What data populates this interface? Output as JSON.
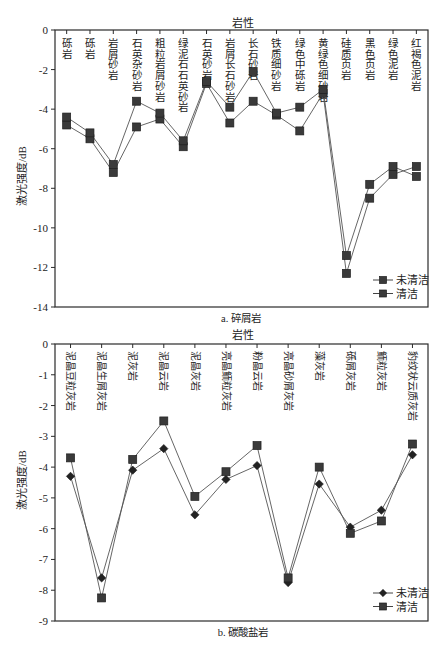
{
  "chart_data": [
    {
      "type": "line",
      "title": "a. 碎屑岩",
      "xlabel": "岩性",
      "ylabel": "激光强度/dB",
      "x_axis_position": "top",
      "ylim": [
        -14,
        0
      ],
      "yticks": [
        0,
        -2,
        -4,
        -6,
        -8,
        -10,
        -12,
        -14
      ],
      "ytick_labels": [
        "0",
        "-2",
        "-4",
        "-6",
        "-8",
        "-10",
        "-12",
        "-14"
      ],
      "grid": false,
      "legend_position": "lower right",
      "categories": [
        "砾岩",
        "砾岩",
        "岩屑砂岩",
        "石英杂砂岩",
        "粗粒岩屑砂岩",
        "绿泥石石英砂岩",
        "石英砂岩",
        "岩屑长石砂岩",
        "长石砂岩",
        "铁质细砂岩",
        "绿色中砾岩",
        "黄绿色细砂岩",
        "硅质页岩",
        "黑色页岩",
        "绿色泥岩",
        "红褐色泥岩"
      ],
      "series": [
        {
          "name": "未清洁",
          "marker": "square",
          "values": [
            -4.8,
            -5.5,
            -7.2,
            -4.9,
            -4.5,
            -5.9,
            -2.7,
            -4.7,
            -3.6,
            -4.3,
            -5.1,
            -3.2,
            -12.3,
            -8.5,
            -7.3,
            -6.9
          ]
        },
        {
          "name": "清洁",
          "marker": "square",
          "values": [
            -4.4,
            -5.2,
            -6.8,
            -3.6,
            -4.2,
            -5.6,
            -2.6,
            -3.9,
            -2.1,
            -4.2,
            -3.9,
            -3.0,
            -11.4,
            -7.8,
            -6.9,
            -7.4
          ]
        }
      ]
    },
    {
      "type": "line",
      "title": "b. 碳酸盐岩",
      "xlabel": "岩性",
      "ylabel": "激光强度/dB",
      "x_axis_position": "top",
      "ylim": [
        -9,
        0
      ],
      "yticks": [
        0,
        -1,
        -2,
        -3,
        -4,
        -5,
        -6,
        -7,
        -8,
        -9
      ],
      "ytick_labels": [
        "0",
        "-1",
        "-2",
        "-3",
        "-4",
        "-5",
        "-6",
        "-7",
        "-8",
        "-9"
      ],
      "grid": false,
      "legend_position": "lower right",
      "categories": [
        "泥晶豆粒灰岩",
        "泥晶生屑灰岩",
        "泥灰岩",
        "泥晶云岩",
        "泥晶灰岩",
        "亮晶鲕粒灰岩",
        "粉晶云岩",
        "亮晶砂屑灰岩",
        "藻灰岩",
        "砾屑灰岩",
        "鲕粒灰岩",
        "豹纹状云质灰岩"
      ],
      "series": [
        {
          "name": "未清洁",
          "marker": "diamond",
          "values": [
            -4.3,
            -7.6,
            -4.1,
            -3.4,
            -5.55,
            -4.4,
            -3.95,
            -7.75,
            -4.55,
            -5.95,
            -5.4,
            -3.6
          ]
        },
        {
          "name": "清洁",
          "marker": "square",
          "values": [
            -3.7,
            -8.25,
            -3.75,
            -2.5,
            -4.95,
            -4.15,
            -3.3,
            -7.6,
            -4.0,
            -6.15,
            -5.75,
            -3.25
          ]
        }
      ]
    }
  ]
}
